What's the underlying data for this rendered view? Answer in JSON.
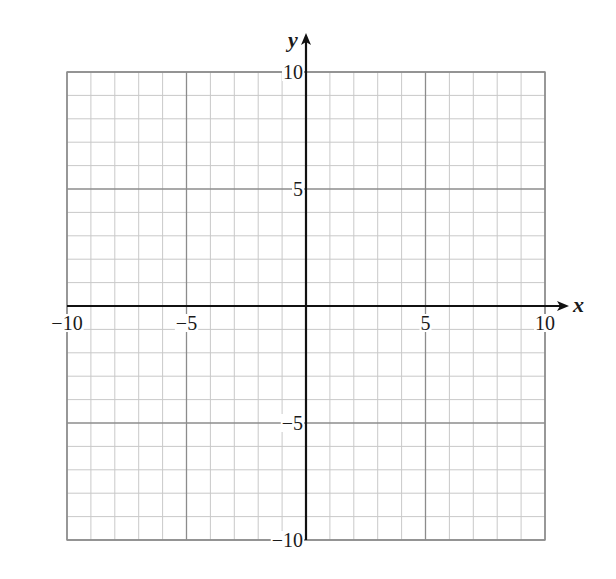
{
  "chart_data": {
    "type": "scatter",
    "title": "",
    "subtitle": "",
    "xlabel": "x",
    "ylabel": "y",
    "xlim": [
      -10,
      10
    ],
    "ylim": [
      -10,
      10
    ],
    "x_ticks": [
      -10,
      -5,
      5,
      10
    ],
    "y_ticks": [
      10,
      5,
      -5,
      -10
    ],
    "x_tick_labels": [
      "−10",
      "−5",
      "5",
      "10"
    ],
    "y_tick_labels": [
      "10",
      "5",
      "−5",
      "−10"
    ],
    "minor_grid_step": 1,
    "major_grid_step": 5,
    "grid": true,
    "legend": null,
    "series": [],
    "colors": {
      "background": "#ffffff",
      "minor_grid": "#c9c9c9",
      "major_grid": "#8c8c8c",
      "border": "#8c8c8c",
      "axis": "#111111",
      "text": "#1a1a1a"
    }
  }
}
